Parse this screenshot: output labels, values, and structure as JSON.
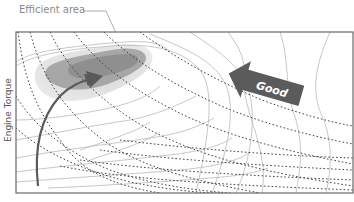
{
  "diagram": {
    "callout": {
      "label": "Efficient area"
    },
    "y_axis": {
      "label": "Engine Torque"
    },
    "direction_arrow": {
      "label": "Good",
      "direction": "up-left"
    },
    "path_arrow": {
      "description": "operating point trajectory rising toward efficient area"
    },
    "colors": {
      "frame": "#6a6a6a",
      "efficient_area_core": "#8e8e8e",
      "efficient_area_halo": "#cfcfcf",
      "contour_lines": "#b9b9b9",
      "iso_power_lines": "#444444",
      "arrow": "#5a5a5a",
      "callout_text": "#8a8a8a"
    }
  }
}
